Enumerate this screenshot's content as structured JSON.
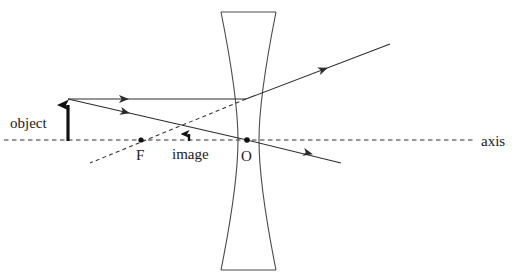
{
  "figure": {
    "title_text": "",
    "type": "ray-diagram-diverging-lens",
    "background_color": "#ffffff",
    "stroke_color": "#3a3a3a",
    "text_color": "#1a1a1a"
  },
  "labels": {
    "object": "object",
    "image": "image",
    "focal_point": "F",
    "optical_center": "O",
    "axis": "axis"
  },
  "geometry": {
    "canvas": {
      "width": 516,
      "height": 280
    },
    "axis": {
      "y": 140,
      "x_start": 4,
      "x_end": 474,
      "style": "dashed"
    },
    "lens": {
      "type": "biconcave",
      "top_y": 12,
      "bottom_y": 270,
      "top_left_x": 221,
      "top_right_x": 276,
      "bottom_left_x": 221,
      "bottom_right_x": 276,
      "waist_left_x": 238,
      "waist_right_x": 259,
      "center_x": 247
    },
    "object_arrow": {
      "x": 68,
      "base_y": 141,
      "tip_y": 99,
      "head": "up"
    },
    "image_arrow": {
      "x": 189,
      "base_y": 141,
      "tip_y": 128,
      "head": "up"
    },
    "points": [
      {
        "name": "F",
        "x": 141,
        "y": 140,
        "label_x": 139,
        "label_y": 159
      },
      {
        "name": "O",
        "x": 247,
        "y": 140,
        "label_x": 244,
        "label_y": 160
      }
    ],
    "rays": [
      {
        "name": "incident-parallel-ray",
        "style": "solid",
        "points": [
          [
            68,
            99
          ],
          [
            246,
            99
          ]
        ],
        "arrow_at": [
          [
            127,
            99
          ]
        ]
      },
      {
        "name": "refracted-parallel-ray",
        "style": "solid",
        "points": [
          [
            246,
            99
          ],
          [
            390,
            44
          ]
        ],
        "arrow_at": [
          [
            325,
            68
          ]
        ]
      },
      {
        "name": "virtual-ray-backward-extension",
        "style": "dashed",
        "points": [
          [
            246,
            99
          ],
          [
            90,
            163
          ]
        ]
      },
      {
        "name": "incident-center-ray",
        "style": "solid",
        "points": [
          [
            68,
            99
          ],
          [
            247,
            140
          ]
        ],
        "arrow_at": [
          [
            128,
            113
          ]
        ]
      },
      {
        "name": "refracted-center-ray",
        "style": "solid",
        "points": [
          [
            247,
            140
          ],
          [
            341,
            163
          ]
        ],
        "arrow_at": [
          [
            310,
            153
          ]
        ]
      },
      {
        "name": "virtual-axis-dashed-to-lens",
        "style": "dashed",
        "points": [
          [
            141,
            140
          ],
          [
            247,
            140
          ]
        ]
      }
    ],
    "label_positions": {
      "object": {
        "x": 10,
        "y": 128
      },
      "image": {
        "x": 172,
        "y": 158
      },
      "axis": {
        "x": 480,
        "y": 146
      }
    }
  }
}
